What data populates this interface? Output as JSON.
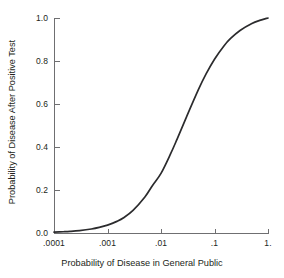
{
  "chart_data": {
    "type": "line",
    "title": "",
    "xlabel": "Probability of Disease in General Public",
    "ylabel": "Probability of Disease After Positive Test",
    "xscale": "log",
    "xlim": [
      0.0001,
      1.0
    ],
    "ylim": [
      0.0,
      1.0
    ],
    "grid": false,
    "legend": null,
    "xtick_labels": [
      ".0001",
      ".001",
      ".01",
      ".1",
      "1."
    ],
    "xtick_values": [
      0.0001,
      0.001,
      0.01,
      0.1,
      1.0
    ],
    "ytick_labels": [
      "0.0",
      "0.2",
      "0.4",
      "0.6",
      "0.8",
      "1.0"
    ],
    "ytick_values": [
      0.0,
      0.2,
      0.4,
      0.6,
      0.8,
      1.0
    ],
    "series": [
      {
        "name": "Posterior probability after positive test",
        "likelihood_ratio": 38,
        "x": [
          0.0001,
          0.00015,
          0.0002,
          0.0003,
          0.0005,
          0.0007,
          0.001,
          0.0015,
          0.002,
          0.003,
          0.005,
          0.007,
          0.01,
          0.015,
          0.02,
          0.03,
          0.05,
          0.07,
          0.1,
          0.15,
          0.2,
          0.3,
          0.5,
          0.7,
          1.0
        ],
        "y": [
          0.0038,
          0.0057,
          0.0075,
          0.0113,
          0.0186,
          0.0259,
          0.0366,
          0.054,
          0.0706,
          0.1051,
          0.1674,
          0.2224,
          0.2773,
          0.3665,
          0.4368,
          0.5404,
          0.6667,
          0.741,
          0.8085,
          0.8702,
          0.9048,
          0.9422,
          0.9744,
          0.9888,
          1.0
        ]
      }
    ]
  },
  "axes": {
    "x_title": "Probability of Disease in General Public",
    "y_title": "Probability of Disease After Positive Test"
  },
  "ticks": {
    "x": [
      {
        "label": ".0001",
        "px": 54
      },
      {
        "label": ".001",
        "px": 107.5
      },
      {
        "label": ".01",
        "px": 161
      },
      {
        "label": ".1",
        "px": 214.5
      },
      {
        "label": "1.",
        "px": 268
      }
    ],
    "y": [
      {
        "label": "1.0",
        "px": 18
      },
      {
        "label": "0.8",
        "px": 61
      },
      {
        "label": "0.6",
        "px": 104
      },
      {
        "label": "0.4",
        "px": 147
      },
      {
        "label": "0.2",
        "px": 190
      },
      {
        "label": "0.0",
        "px": 233
      }
    ]
  }
}
